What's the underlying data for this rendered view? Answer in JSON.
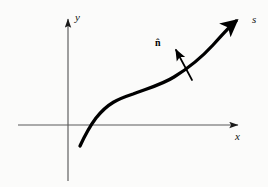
{
  "figure": {
    "background_color": "#fbfbfa",
    "width": 268,
    "height": 187
  },
  "axes": {
    "color": "#5a5a5a",
    "origin": {
      "x": 68,
      "y": 125
    },
    "x_axis": {
      "label": "x",
      "label_style": "italic",
      "start": {
        "x": 18,
        "y": 125
      },
      "end": {
        "x": 245,
        "y": 125
      },
      "arrow": "right"
    },
    "y_axis": {
      "label": "y",
      "label_style": "italic",
      "start": {
        "x": 68,
        "y": 181
      },
      "end": {
        "x": 68,
        "y": 11
      },
      "arrow": "up"
    }
  },
  "curve": {
    "label": "s",
    "label_style": "italic",
    "color": "#000000",
    "stroke_width": 3.2,
    "arrow": "end",
    "description": "smooth S-shaped curve rising left to right",
    "points": [
      {
        "x": 80,
        "y": 146
      },
      {
        "x": 95,
        "y": 117
      },
      {
        "x": 130,
        "y": 95
      },
      {
        "x": 170,
        "y": 78
      },
      {
        "x": 205,
        "y": 57
      },
      {
        "x": 228,
        "y": 32
      },
      {
        "x": 241,
        "y": 19
      }
    ]
  },
  "normal_vector": {
    "label": "n̂",
    "label_plain": "n-hat",
    "color": "#000000",
    "stroke_width": 1.6,
    "tail": {
      "x": 192,
      "y": 80
    },
    "tip": {
      "x": 174,
      "y": 46
    },
    "arrow": "end",
    "description": "unit normal vector pointing up and to the left of the curve"
  },
  "colors": {
    "ink": "#000000",
    "axis": "#5a5a5a",
    "background": "#fbfbfa"
  }
}
